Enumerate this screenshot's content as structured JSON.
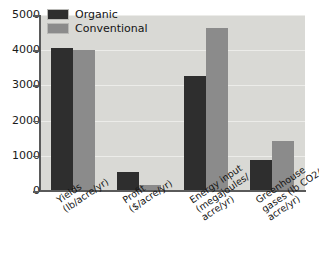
{
  "chart_data": {
    "type": "bar",
    "title": "",
    "xlabel": "",
    "ylabel": "",
    "ylim": [
      0,
      5000
    ],
    "yticks": [
      0,
      1000,
      2000,
      3000,
      4000,
      5000
    ],
    "ytick_labels": [
      "0",
      "1000",
      "2000",
      "3000",
      "4000",
      "5000"
    ],
    "grid": true,
    "legend_position": "top-left",
    "categories": [
      "Yields (lb/acre/yr)",
      "Profit ($/acre/yr)",
      "Energy input (megajoules/acre/yr)",
      "Greenhouse gases (lb CO2/acre/yr)"
    ],
    "category_lines": [
      [
        "Yields",
        "(lb/acre/yr)"
      ],
      [
        "Profit",
        "($/acre/yr)"
      ],
      [
        "Energy input",
        "(megajoules/",
        "acre/yr)"
      ],
      [
        "Greenhouse",
        "gases (lb CO2/",
        "acre/yr)"
      ]
    ],
    "series": [
      {
        "name": "Organic",
        "color": "#2e2e2e",
        "values": [
          4050,
          550,
          3280,
          870
        ]
      },
      {
        "name": "Conventional",
        "color": "#8b8b8b",
        "values": [
          4000,
          185,
          4640,
          1420
        ]
      }
    ]
  },
  "legend": {
    "items": [
      {
        "label": "Organic",
        "color": "#2e2e2e"
      },
      {
        "label": "Conventional",
        "color": "#8b8b8b"
      }
    ]
  },
  "colors": {
    "plot_background": "#d9d9d5",
    "gridline": "#ecece9",
    "axis": "#5a5a5a",
    "text": "#141414",
    "page_background": "#ffffff"
  }
}
